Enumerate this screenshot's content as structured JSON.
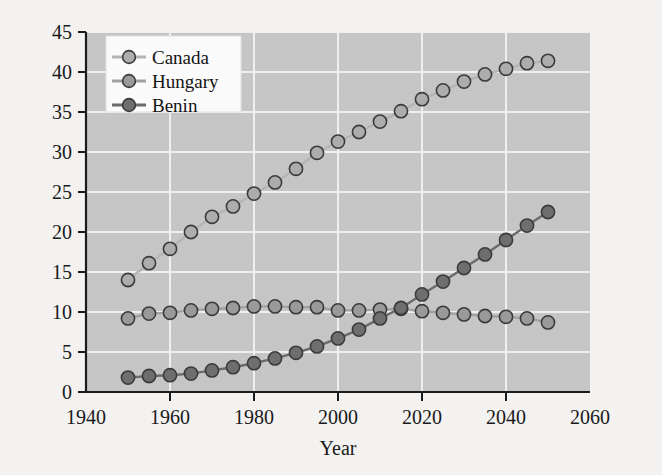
{
  "chart_data": {
    "type": "line",
    "title": "",
    "xlabel": "Year",
    "ylabel": "",
    "xlim": [
      1940,
      2060
    ],
    "ylim": [
      0,
      45
    ],
    "xticks": [
      1940,
      1960,
      1980,
      2000,
      2020,
      2040,
      2060
    ],
    "yticks": [
      0,
      5,
      10,
      15,
      20,
      25,
      30,
      35,
      40,
      45
    ],
    "grid": true,
    "legend_position": "upper left",
    "marker": "circle",
    "x": [
      1950,
      1955,
      1960,
      1965,
      1970,
      1975,
      1980,
      1985,
      1990,
      1995,
      2000,
      2005,
      2010,
      2015,
      2020,
      2025,
      2030,
      2035,
      2040,
      2045,
      2050
    ],
    "series": [
      {
        "name": "Canada",
        "color": "#adadad",
        "line_color": "#b5b5b5",
        "values": [
          14.0,
          16.1,
          17.9,
          20.0,
          21.9,
          23.2,
          24.8,
          26.2,
          27.9,
          29.9,
          31.3,
          32.5,
          33.8,
          35.1,
          36.6,
          37.7,
          38.8,
          39.7,
          40.4,
          41.1,
          41.4
        ]
      },
      {
        "name": "Hungary",
        "color": "#9a9a9a",
        "line_color": "#a2a2a2",
        "values": [
          9.2,
          9.8,
          9.9,
          10.2,
          10.4,
          10.5,
          10.7,
          10.7,
          10.6,
          10.6,
          10.2,
          10.2,
          10.3,
          10.4,
          10.1,
          9.9,
          9.7,
          9.5,
          9.4,
          9.2,
          8.7
        ]
      },
      {
        "name": "Benin",
        "color": "#6f6f6f",
        "line_color": "#6b6b6b",
        "values": [
          1.8,
          2.0,
          2.1,
          2.3,
          2.7,
          3.1,
          3.6,
          4.2,
          4.9,
          5.7,
          6.7,
          7.8,
          9.2,
          10.5,
          12.2,
          13.8,
          15.5,
          17.2,
          19.0,
          20.8,
          22.5
        ]
      }
    ]
  },
  "legend": {
    "entries": [
      {
        "label": "Canada"
      },
      {
        "label": "Hungary"
      },
      {
        "label": "Benin"
      }
    ]
  },
  "axes": {
    "x_title": "Year",
    "x_tick_labels": [
      "1940",
      "1960",
      "1980",
      "2000",
      "2020",
      "2040",
      "2060"
    ],
    "y_tick_labels": [
      "0",
      "5",
      "10",
      "15",
      "20",
      "25",
      "30",
      "35",
      "40",
      "45"
    ]
  },
  "style": {
    "plot_background": "#c6c6c6",
    "figure_background": "#f4f3f1",
    "grid_color": "#f0f0f0",
    "axis_color": "#1c1c1c",
    "legend_background": "#fbfbfb"
  }
}
